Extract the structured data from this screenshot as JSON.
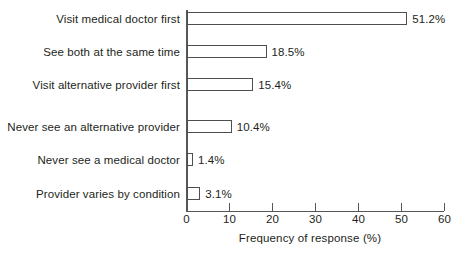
{
  "chart_data": {
    "type": "bar",
    "orientation": "horizontal",
    "title": "",
    "xlabel": "Frequency of response (%)",
    "ylabel": "",
    "xlim": [
      0,
      60
    ],
    "xticks": [
      0,
      10,
      20,
      30,
      40,
      50,
      60
    ],
    "xtick_labels": [
      "0",
      "10",
      "20",
      "30",
      "40",
      "50",
      "60"
    ],
    "grid": false,
    "legend": null,
    "categories": [
      "Visit medical doctor first",
      "See both at the same time",
      "Visit alternative provider first",
      "Never see an alternative provider",
      "Never see a medical doctor",
      "Provider varies by condition"
    ],
    "values": [
      51.2,
      18.5,
      15.4,
      10.4,
      1.4,
      3.1
    ],
    "value_labels": [
      "51.2%",
      "18.5%",
      "15.4%",
      "10.4%",
      "1.4%",
      "3.1%"
    ],
    "bar_fill_color": "#ffffff",
    "bar_edge_color": "#4d4f51",
    "axis_color": "#555759",
    "text_color": "#231f20",
    "background_color": "#ffffff"
  }
}
